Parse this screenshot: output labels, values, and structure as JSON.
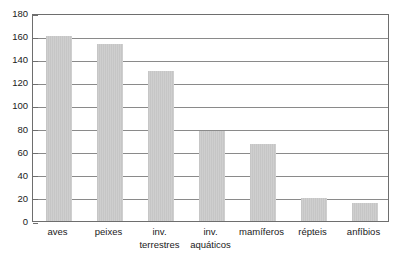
{
  "chart_data": {
    "type": "bar",
    "title": "",
    "subtitle": "",
    "xlabel": "",
    "ylabel": "",
    "categories": [
      "aves",
      "peixes",
      "inv. terrestres",
      "inv. aquáticos",
      "mamíferos",
      "répteis",
      "anfíbios"
    ],
    "category_lines": [
      [
        "aves"
      ],
      [
        "peixes"
      ],
      [
        "inv.",
        "terrestres"
      ],
      [
        "inv.",
        "aquáticos"
      ],
      [
        "mamíferos"
      ],
      [
        "répteis"
      ],
      [
        "anfíbios"
      ]
    ],
    "values": [
      160,
      153,
      130,
      78,
      67,
      20,
      16
    ],
    "ylim": [
      0,
      180
    ],
    "ytick_step": 20,
    "yticks": [
      0,
      20,
      40,
      60,
      80,
      100,
      120,
      140,
      160,
      180
    ],
    "ytick_labels": [
      "0",
      "20",
      "40",
      "60",
      "80",
      "100",
      "120",
      "140",
      "160",
      "180"
    ],
    "grid": true,
    "grid_axis": "y",
    "legend": false,
    "legend_position": "none",
    "bar_color": "#c8c8c8",
    "frame_color": "#6e6e6e",
    "gridline_color": "#8a8a8a",
    "text_color": "#1a1a1a",
    "background_color": "#ffffff"
  }
}
